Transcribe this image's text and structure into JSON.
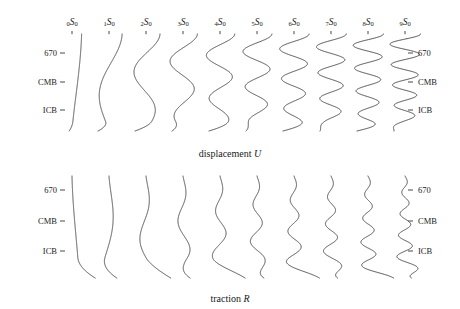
{
  "figure": {
    "width": 460,
    "height": 309,
    "background": "#ffffff",
    "line_color": "#3a3a3a",
    "text_color": "#1a1a1a"
  },
  "panels": [
    {
      "id": "displacement",
      "caption_prefix": "displacement ",
      "caption_var": "U",
      "caption_x": 230,
      "caption_y": 148,
      "top": 34,
      "bottom": 131,
      "depth_labels": [
        {
          "text": "670",
          "y": 53
        },
        {
          "text": "CMB",
          "y": 82
        },
        {
          "text": "ICB",
          "y": 110
        }
      ]
    },
    {
      "id": "traction",
      "caption_prefix": "traction ",
      "caption_var": "R",
      "caption_x": 230,
      "caption_y": 293,
      "top": 176,
      "bottom": 278,
      "depth_labels": [
        {
          "text": "670",
          "y": 190
        },
        {
          "text": "CMB",
          "y": 221
        },
        {
          "text": "ICB",
          "y": 251
        }
      ]
    }
  ],
  "axis": {
    "left_label_x": 57,
    "left_tick_x1": 60,
    "left_tick_x2": 65,
    "right_label_x": 418,
    "right_tick_x1": 408,
    "right_tick_x2": 413
  },
  "columns": [
    {
      "overtone": "0",
      "symbol": "S",
      "angular_order": "0",
      "x": 72,
      "label_y": 18,
      "tick_y": 31
    },
    {
      "overtone": "1",
      "symbol": "S",
      "angular_order": "0",
      "x": 109,
      "label_y": 18,
      "tick_y": 31
    },
    {
      "overtone": "2",
      "symbol": "S",
      "angular_order": "0",
      "x": 146,
      "label_y": 18,
      "tick_y": 31
    },
    {
      "overtone": "3",
      "symbol": "S",
      "angular_order": "0",
      "x": 183,
      "label_y": 18,
      "tick_y": 31
    },
    {
      "overtone": "4",
      "symbol": "S",
      "angular_order": "0",
      "x": 220,
      "label_y": 18,
      "tick_y": 31
    },
    {
      "overtone": "5",
      "symbol": "S",
      "angular_order": "0",
      "x": 257,
      "label_y": 18,
      "tick_y": 31
    },
    {
      "overtone": "6",
      "symbol": "S",
      "angular_order": "0",
      "x": 294,
      "label_y": 18,
      "tick_y": 31
    },
    {
      "overtone": "7",
      "symbol": "S",
      "angular_order": "0",
      "x": 331,
      "label_y": 18,
      "tick_y": 31
    },
    {
      "overtone": "8",
      "symbol": "S",
      "angular_order": "0",
      "x": 368,
      "label_y": 18,
      "tick_y": 31
    },
    {
      "overtone": "9",
      "symbol": "S",
      "angular_order": "0",
      "x": 405,
      "label_y": 18,
      "tick_y": 31
    }
  ],
  "chart_data": {
    "type": "line",
    "title": "",
    "xlabel": "",
    "ylabel": "radius",
    "grid": false,
    "legend": "none",
    "radius_axis": {
      "top_is_surface": true,
      "markers": [
        "670",
        "CMB",
        "ICB"
      ],
      "marker_fraction_from_top": [
        0.195,
        0.495,
        0.783
      ]
    },
    "series": [
      {
        "name": "0S0",
        "overtone": 0,
        "nodes": 0,
        "amplitude_U": 0.55,
        "amplitude_R": 0.3
      },
      {
        "name": "1S0",
        "overtone": 1,
        "nodes": 1,
        "amplitude_U": 0.75,
        "amplitude_R": 0.34
      },
      {
        "name": "2S0",
        "overtone": 2,
        "nodes": 2,
        "amplitude_U": 0.8,
        "amplitude_R": 0.36
      },
      {
        "name": "3S0",
        "overtone": 3,
        "nodes": 3,
        "amplitude_U": 0.82,
        "amplitude_R": 0.37
      },
      {
        "name": "4S0",
        "overtone": 4,
        "nodes": 4,
        "amplitude_U": 0.84,
        "amplitude_R": 0.38
      },
      {
        "name": "5S0",
        "overtone": 5,
        "nodes": 5,
        "amplitude_U": 0.85,
        "amplitude_R": 0.38
      },
      {
        "name": "6S0",
        "overtone": 6,
        "nodes": 6,
        "amplitude_U": 0.86,
        "amplitude_R": 0.39
      },
      {
        "name": "7S0",
        "overtone": 7,
        "nodes": 7,
        "amplitude_U": 0.87,
        "amplitude_R": 0.39
      },
      {
        "name": "8S0",
        "overtone": 8,
        "nodes": 8,
        "amplitude_U": 0.88,
        "amplitude_R": 0.4
      },
      {
        "name": "9S0",
        "overtone": 9,
        "nodes": 9,
        "amplitude_U": 0.89,
        "amplitude_R": 0.4
      }
    ]
  }
}
